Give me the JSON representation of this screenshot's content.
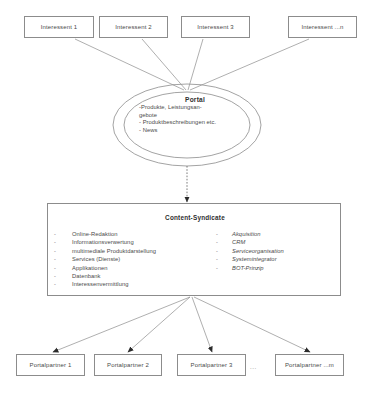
{
  "diagram": {
    "stroke_color": "#8c8c8c",
    "text_color": "#4a4a4a",
    "background": "#ffffff"
  },
  "top_nodes": [
    {
      "label": "Interessent 1"
    },
    {
      "label": "Interessent 2"
    },
    {
      "label": "Interessent 3"
    },
    {
      "label": "Interessent ...n"
    }
  ],
  "portal": {
    "title": "Portal",
    "lines": [
      "-Produkte, Leistungsan-",
      "gebote",
      "- Produktbeschreibungen etc.",
      "- News"
    ]
  },
  "syndicate": {
    "title": "Content-Syndicate",
    "bullet": "-",
    "left_items": [
      "Online-Redaktion",
      "Informationsverwertung",
      "multimediale Produktdarstellung",
      "Services (Dienste)",
      "Applikationen",
      "Datenbank",
      "Interessenvermittlung"
    ],
    "right_items": [
      "Akquisition",
      "CRM",
      "Serviceorganisation",
      "Systemintegrator",
      "BOT-Prinzip"
    ]
  },
  "bottom_nodes": [
    {
      "label": "Portalpartner 1"
    },
    {
      "label": "Portalpartner 2"
    },
    {
      "label": "Portalpartner 3"
    },
    {
      "label": "Portalpartner ...m"
    }
  ],
  "ellipsis": "..."
}
